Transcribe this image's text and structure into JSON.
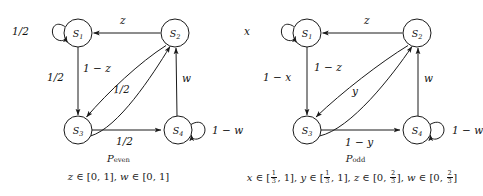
{
  "figure": {
    "type": "markov-chain-transition-diagrams",
    "panels": [
      {
        "id": "p-even",
        "caption_name": "P",
        "caption_sub": "even",
        "constraint": "z ∈ [0, 1], w ∈ [0, 1]",
        "nodes": [
          {
            "id": "S1",
            "label": "S",
            "sub": "1"
          },
          {
            "id": "S2",
            "label": "S",
            "sub": "2"
          },
          {
            "id": "S3",
            "label": "S",
            "sub": "3"
          },
          {
            "id": "S4",
            "label": "S",
            "sub": "4"
          }
        ],
        "edges": [
          {
            "from": "S1",
            "to": "S1",
            "label": "1/2",
            "kind": "self-loop-left"
          },
          {
            "from": "S2",
            "to": "S1",
            "label": "z",
            "kind": "straight-horizontal"
          },
          {
            "from": "S1",
            "to": "S3",
            "label": "1/2",
            "kind": "straight-vertical"
          },
          {
            "from": "S2",
            "to": "S3",
            "label": "1 − z",
            "kind": "curve"
          },
          {
            "from": "S3",
            "to": "S2",
            "label": "1/2",
            "kind": "curve"
          },
          {
            "from": "S4",
            "to": "S2",
            "label": "w",
            "kind": "straight-vertical"
          },
          {
            "from": "S3",
            "to": "S4",
            "label": "1/2",
            "kind": "straight-horizontal"
          },
          {
            "from": "S4",
            "to": "S4",
            "label": "1 − w",
            "kind": "self-loop-right"
          }
        ]
      },
      {
        "id": "p-odd",
        "caption_name": "P",
        "caption_sub": "odd",
        "constraint": "x ∈ [1/3, 1], y ∈ [1/3, 1], z ∈ [0, 2/3], w ∈ [0, 2/3]",
        "nodes": [
          {
            "id": "S1",
            "label": "S",
            "sub": "1"
          },
          {
            "id": "S2",
            "label": "S",
            "sub": "2"
          },
          {
            "id": "S3",
            "label": "S",
            "sub": "3"
          },
          {
            "id": "S4",
            "label": "S",
            "sub": "4"
          }
        ],
        "edges": [
          {
            "from": "S1",
            "to": "S1",
            "label": "x",
            "kind": "self-loop-left"
          },
          {
            "from": "S2",
            "to": "S1",
            "label": "z",
            "kind": "straight-horizontal"
          },
          {
            "from": "S1",
            "to": "S3",
            "label": "1 − x",
            "kind": "straight-vertical"
          },
          {
            "from": "S2",
            "to": "S3",
            "label": "1 − z",
            "kind": "curve"
          },
          {
            "from": "S3",
            "to": "S2",
            "label": "y",
            "kind": "curve"
          },
          {
            "from": "S4",
            "to": "S2",
            "label": "w",
            "kind": "straight-vertical"
          },
          {
            "from": "S3",
            "to": "S4",
            "label": "1 − y",
            "kind": "straight-horizontal"
          },
          {
            "from": "S4",
            "to": "S4",
            "label": "1 − w",
            "kind": "self-loop-right"
          }
        ]
      }
    ]
  },
  "labels": {
    "left": {
      "s1_self": "1/2",
      "s2_to_s1": "z",
      "s1_to_s3": "1/2",
      "s2_to_s3": "1 − z",
      "s3_to_s2": "1/2",
      "s4_to_s2": "w",
      "s3_to_s4": "1/2",
      "s4_self": "1 − w"
    },
    "right": {
      "s1_self": "x",
      "s2_to_s1": "z",
      "s1_to_s3": "1 − x",
      "s2_to_s3": "1 − z",
      "s3_to_s2": "y",
      "s4_to_s2": "w",
      "s3_to_s4": "1 − y",
      "s4_self": "1 − w"
    }
  },
  "node_text": {
    "s1_main": "S",
    "s1_sub": "1",
    "s2_main": "S",
    "s2_sub": "2",
    "s3_main": "S",
    "s3_sub": "3",
    "s4_main": "S",
    "s4_sub": "4"
  },
  "captions": {
    "left_name": "P",
    "left_sub": "even",
    "right_name": "P",
    "right_sub": "odd",
    "left_constraint_parts": {
      "z_var": "z",
      "in1": "∈ [0, 1],",
      "w_var": "w",
      "in2": "∈ [0, 1]"
    },
    "right_constraint_parts": {
      "x_var": "x",
      "y_var": "y",
      "z_var": "z",
      "w_var": "w",
      "one": "1",
      "three": "3",
      "two": "2",
      "upper": "1",
      "zero": "0"
    }
  },
  "colors": {
    "stroke": "#1a1a1a",
    "background": "#ffffff",
    "text": "#111111"
  }
}
